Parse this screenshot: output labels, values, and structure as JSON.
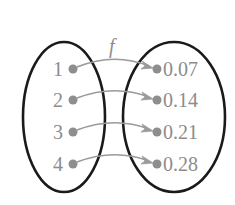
{
  "diagram": {
    "type": "function-mapping",
    "function_name": "f",
    "domain": {
      "elements": [
        "1",
        "2",
        "3",
        "4"
      ]
    },
    "codomain": {
      "elements": [
        "0.07",
        "0.14",
        "0.21",
        "0.28"
      ]
    },
    "mappings": [
      {
        "from": "1",
        "to": "0.07"
      },
      {
        "from": "2",
        "to": "0.14"
      },
      {
        "from": "3",
        "to": "0.21"
      },
      {
        "from": "4",
        "to": "0.28"
      }
    ],
    "colors": {
      "ellipse_stroke": "#1a1a1a",
      "element_gray": "#8c8c8c",
      "background": "#ffffff"
    }
  }
}
